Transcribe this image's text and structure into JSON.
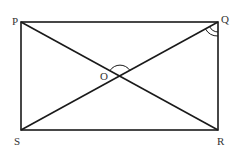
{
  "diagram": {
    "type": "rectangle-with-diagonals",
    "vertices": {
      "P": {
        "label": "P",
        "x": 21,
        "y": 22
      },
      "Q": {
        "label": "Q",
        "x": 218,
        "y": 22
      },
      "R": {
        "label": "R",
        "x": 218,
        "y": 130
      },
      "S": {
        "label": "S",
        "x": 21,
        "y": 130
      }
    },
    "center": {
      "label": "O",
      "x": 120,
      "y": 76
    },
    "angle_marks": [
      {
        "at": "O",
        "angle": "POQ",
        "arcs": 1
      },
      {
        "at": "Q",
        "angle": "PQS/SQR",
        "arcs": 2
      }
    ],
    "stroke_color": "#1a1a1a"
  }
}
